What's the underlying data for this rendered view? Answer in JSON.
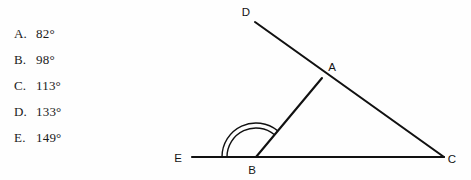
{
  "question": {
    "choices": [
      {
        "letter": "A.",
        "value": "82°",
        "top": 26
      },
      {
        "letter": "B.",
        "value": "98°",
        "top": 52
      },
      {
        "letter": "C.",
        "value": "113°",
        "top": 78
      },
      {
        "letter": "D.",
        "value": "133°",
        "top": 104
      },
      {
        "letter": "E.",
        "value": "149°",
        "top": 130
      }
    ]
  },
  "figure": {
    "type": "geometry-diagram",
    "stroke_color": "#111111",
    "points": [
      {
        "name": "D",
        "label": "D",
        "x": 95,
        "y": 22,
        "label_x": 86,
        "label_y": 16
      },
      {
        "name": "A",
        "label": "A",
        "x": 162,
        "y": 78,
        "label_x": 172,
        "label_y": 71
      },
      {
        "name": "C",
        "label": "C",
        "x": 284,
        "y": 157,
        "label_x": 292,
        "label_y": 163
      },
      {
        "name": "B",
        "label": "B",
        "x": 96,
        "y": 157,
        "label_x": 92,
        "label_y": 174
      },
      {
        "name": "E",
        "label": "E",
        "x": 32,
        "y": 157,
        "label_x": 18,
        "label_y": 162
      }
    ],
    "segments": [
      {
        "name": "line-D-to-C",
        "from": "D",
        "to": "C"
      },
      {
        "name": "line-E-to-C",
        "from": "E",
        "to": "C"
      },
      {
        "name": "segment-B-to-A",
        "from": "B",
        "to": "A"
      }
    ],
    "angle_marks": [
      {
        "name": "angle-DBE-arc-outer",
        "vertex": "B",
        "radius": 34
      },
      {
        "name": "angle-DBE-arc-inner",
        "vertex": "B",
        "radius": 29
      }
    ]
  }
}
